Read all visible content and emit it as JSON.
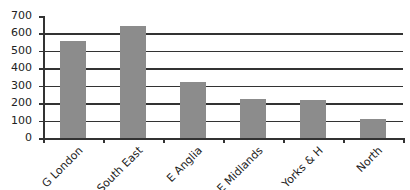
{
  "chart_data": {
    "type": "bar",
    "title": "",
    "xlabel": "",
    "ylabel": "",
    "categories": [
      "G London",
      "South East",
      "E Anglia",
      "E Midlands",
      "Yorks & H",
      "North"
    ],
    "values": [
      555,
      640,
      320,
      225,
      220,
      110
    ],
    "ylim": [
      0,
      700
    ],
    "yticks": [
      0,
      100,
      200,
      300,
      400,
      500,
      600,
      700
    ],
    "grid": true,
    "legend": null,
    "bar_color": "#8c8c8c"
  }
}
